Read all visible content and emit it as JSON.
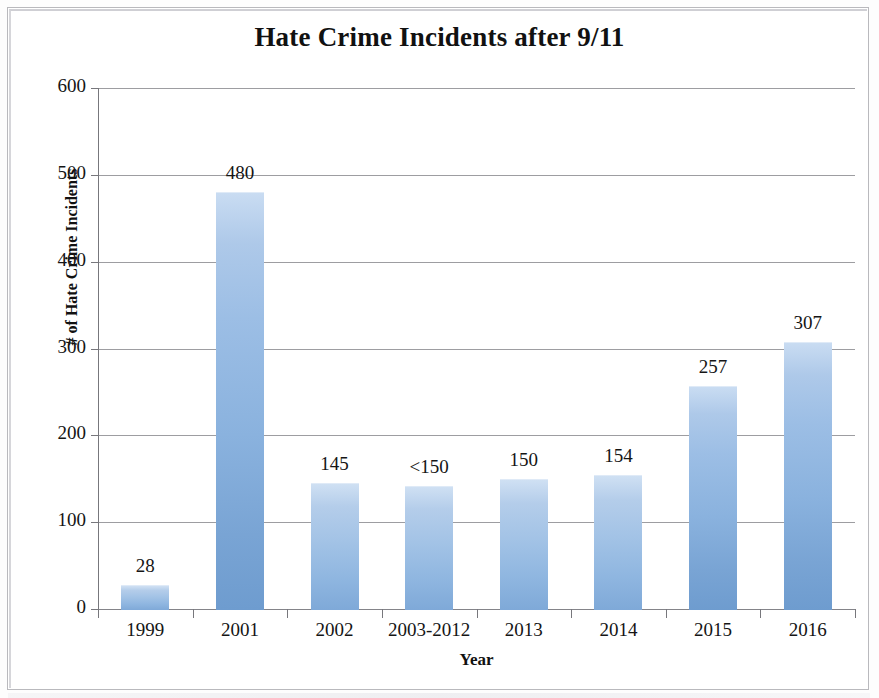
{
  "chart_data": {
    "type": "bar",
    "title": "Hate Crime Incidents after 9/11",
    "xlabel": "Year",
    "ylabel": "# of Hate Crime Incidents",
    "categories": [
      "1999",
      "2001",
      "2002",
      "2003-2012",
      "2013",
      "2014",
      "2015",
      "2016"
    ],
    "values": [
      28,
      480,
      145,
      142,
      150,
      154,
      257,
      307
    ],
    "data_labels": [
      "28",
      "480",
      "145",
      "<150",
      "150",
      "154",
      "257",
      "307"
    ],
    "ylim": [
      0,
      600
    ],
    "yticks": [
      0,
      100,
      200,
      300,
      400,
      500,
      600
    ],
    "ytick_labels": [
      "0",
      "100",
      "200",
      "300",
      "400",
      "500",
      "600"
    ],
    "grid": true,
    "grid_axis": "y",
    "legend": false,
    "legend_position": "none",
    "bar_color": "#a3c3e6",
    "bar_color_top": "#cfe0f3",
    "bar_color_bottom": "#7fa9d8",
    "background_color": "#ffffff",
    "axis_color": "#77777c",
    "text_color": "#151515",
    "series": [
      {
        "name": "# of Hate Crime Incidents",
        "values": [
          28,
          480,
          145,
          142,
          150,
          154,
          257,
          307
        ]
      }
    ]
  }
}
